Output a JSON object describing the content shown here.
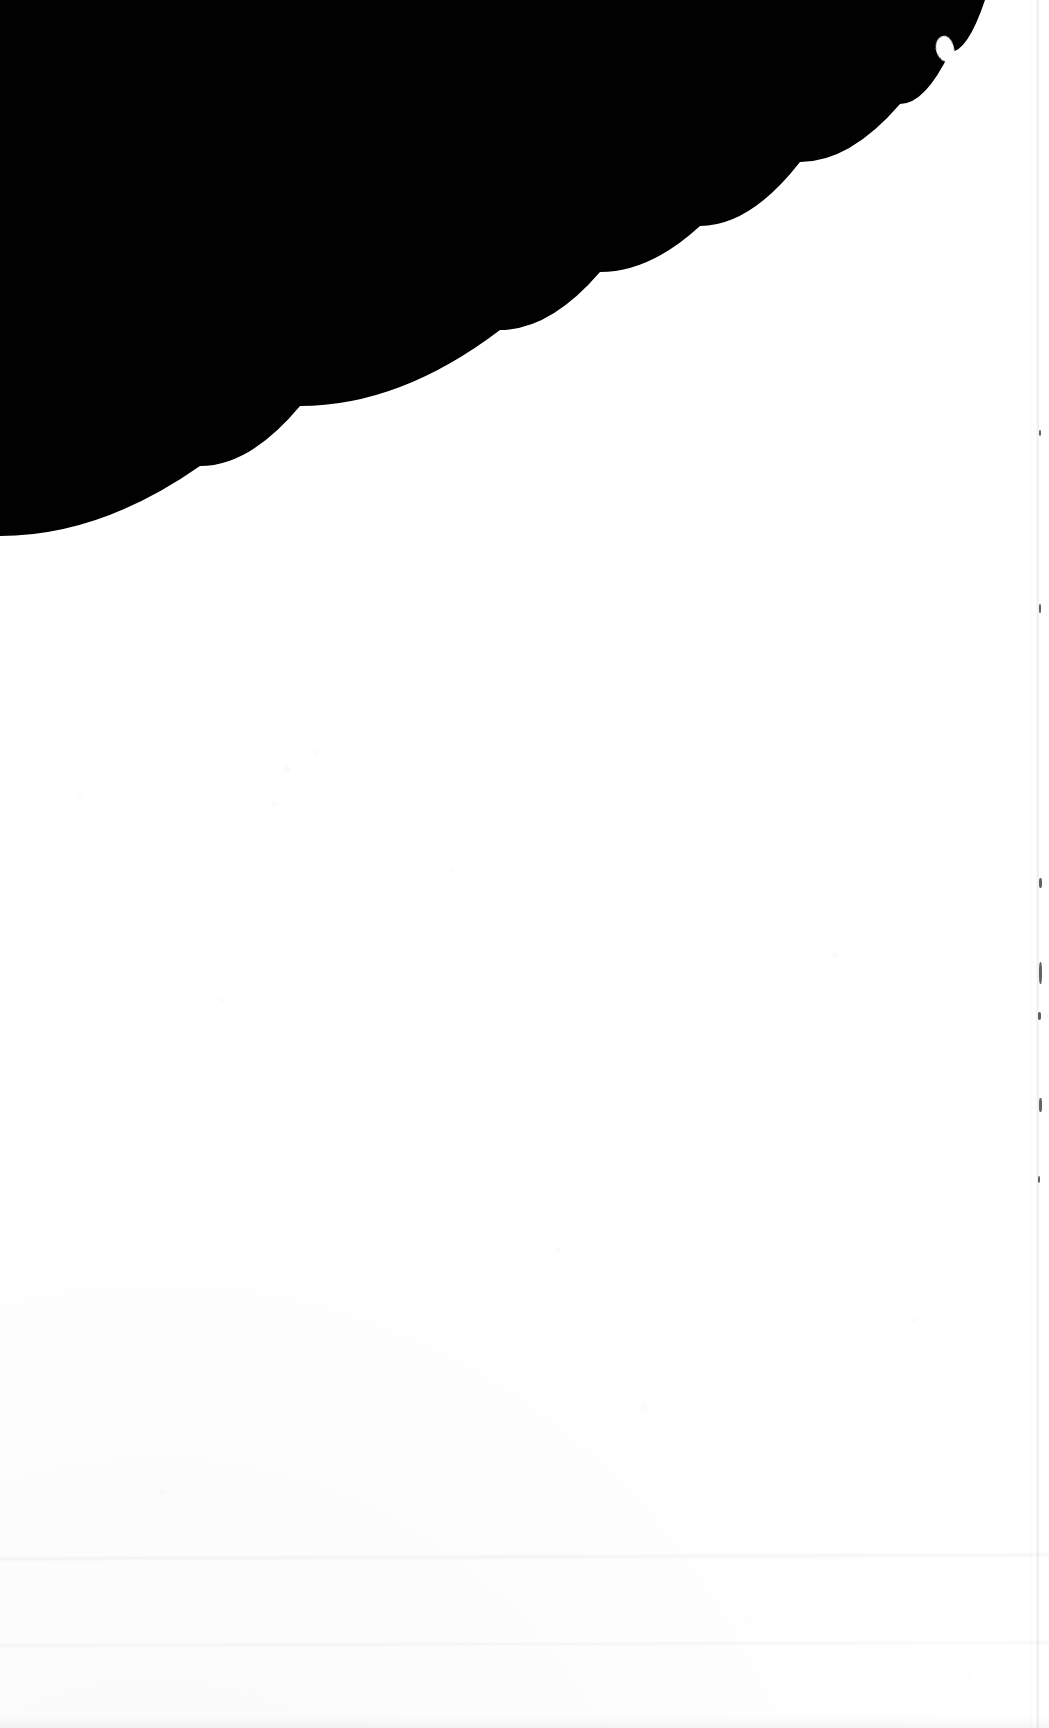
{
  "image": {
    "width": 1049,
    "height": 1728,
    "alt_text": "Scanned page corner: black backdrop in the upper left, blank white paper sheet filling the rest, separated by a smooth curved edge.",
    "content_text": ""
  },
  "colors": {
    "backdrop": "#010101",
    "paper": "#ffffff",
    "seam_line": "rgba(0,0,0,0.085)",
    "crease": "rgba(0,0,0,0.035)"
  },
  "regions": [
    {
      "name": "backdrop",
      "label": "Dark scanner backdrop",
      "fill": "#010101",
      "position": "upper-left"
    },
    {
      "name": "paper-sheet",
      "label": "Blank white page",
      "fill": "#ffffff",
      "position": "lower-right, fills most of frame"
    }
  ],
  "curve": {
    "name": "page-edge",
    "label": "Curved paper edge",
    "description": "Concave-up sweep from the left edge to the top edge",
    "points": [
      [
        0,
        536
      ],
      [
        200,
        466
      ],
      [
        300,
        406
      ],
      [
        500,
        330
      ],
      [
        600,
        272
      ],
      [
        700,
        226
      ],
      [
        800,
        162
      ],
      [
        900,
        104
      ],
      [
        950,
        52
      ],
      [
        985,
        0
      ]
    ]
  },
  "artifacts": {
    "notch": {
      "name": "edge-notch",
      "label": "Small bump on the page edge",
      "x": 945,
      "y": 48,
      "width": 18,
      "height": 26
    },
    "right_seam": {
      "name": "right-scan-seam",
      "label": "Faint vertical seam near the right edge",
      "x": 1036,
      "width": 3
    },
    "seam_specks": [
      {
        "x": 1039,
        "y": 878,
        "w": 3,
        "h": 10
      },
      {
        "x": 1039,
        "y": 962,
        "w": 3,
        "h": 22
      },
      {
        "x": 1038,
        "y": 1012,
        "w": 3,
        "h": 8
      },
      {
        "x": 1039,
        "y": 1098,
        "w": 3,
        "h": 14
      },
      {
        "x": 1038,
        "y": 1176,
        "w": 2,
        "h": 7
      },
      {
        "x": 1039,
        "y": 604,
        "w": 2,
        "h": 9
      },
      {
        "x": 1039,
        "y": 430,
        "w": 2,
        "h": 6
      }
    ],
    "creases": [
      {
        "name": "crease-upper",
        "y": 1556,
        "label": "Faint horizontal crease"
      },
      {
        "name": "crease-lower",
        "y": 1643,
        "label": "Faint horizontal crease"
      }
    ],
    "grain_specks": [
      {
        "x": 314,
        "y": 750,
        "d": 5
      },
      {
        "x": 282,
        "y": 765,
        "d": 9
      },
      {
        "x": 271,
        "y": 801,
        "d": 6
      },
      {
        "x": 350,
        "y": 866,
        "d": 4
      },
      {
        "x": 449,
        "y": 868,
        "d": 5
      },
      {
        "x": 219,
        "y": 998,
        "d": 5
      },
      {
        "x": 832,
        "y": 952,
        "d": 6
      },
      {
        "x": 78,
        "y": 794,
        "d": 5
      },
      {
        "x": 556,
        "y": 1246,
        "d": 5
      },
      {
        "x": 640,
        "y": 1404,
        "d": 6
      },
      {
        "x": 912,
        "y": 1318,
        "d": 5
      },
      {
        "x": 160,
        "y": 1490,
        "d": 5
      },
      {
        "x": 744,
        "y": 1620,
        "d": 4
      },
      {
        "x": 968,
        "y": 1674,
        "d": 4
      }
    ]
  }
}
